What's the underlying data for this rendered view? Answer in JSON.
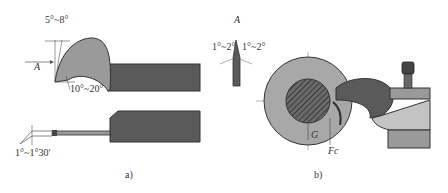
{
  "figure_a": {
    "caption": "a)",
    "angle_top": "5°~8°",
    "angle_bottom": "10°~20°",
    "view_arrow": "A",
    "angle_side": "1°~1°30′"
  },
  "view_a": {
    "title": "A",
    "angle_left": "1°~2°",
    "angle_right": "1°~2°"
  },
  "figure_b": {
    "caption": "b)",
    "force_g": "G",
    "force_fc": "Fc"
  },
  "colors": {
    "tool_dark": "#5a5a5a",
    "tool_mid": "#9a9a9a",
    "tool_light": "#c4c4c4",
    "outline": "#333333"
  }
}
